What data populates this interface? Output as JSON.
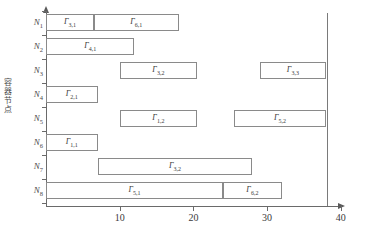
{
  "chart_data": {
    "type": "bar",
    "orientation": "horizontal",
    "title": "",
    "xlabel": "",
    "ylabel": "容器节点",
    "xlim": [
      0,
      42
    ],
    "ylim": [
      0,
      8
    ],
    "grid": false,
    "legend": null,
    "xticks": [
      10,
      20,
      30,
      40
    ],
    "xtick_labels": [
      "10",
      "20",
      "30",
      "40"
    ],
    "categories": [
      "N1",
      "N2",
      "N3",
      "N4",
      "N5",
      "N6",
      "N7",
      "N8"
    ],
    "annotations": [
      {
        "name": "threshold-line",
        "type": "vline",
        "x": 38
      }
    ],
    "rows": [
      {
        "category": "N1",
        "bars": [
          {
            "label": "Γ",
            "sub": "3,1",
            "start": 0,
            "end": 6.5
          },
          {
            "label": "Γ",
            "sub": "6,1",
            "start": 6.5,
            "end": 18
          }
        ]
      },
      {
        "category": "N2",
        "bars": [
          {
            "label": "Γ",
            "sub": "4,1",
            "start": 0,
            "end": 12
          }
        ]
      },
      {
        "category": "N3",
        "bars": [
          {
            "label": "Γ",
            "sub": "3,2",
            "start": 10,
            "end": 20.5
          },
          {
            "label": "Γ",
            "sub": "3,3",
            "start": 29,
            "end": 38
          }
        ]
      },
      {
        "category": "N4",
        "bars": [
          {
            "label": "Γ",
            "sub": "2,1",
            "start": 0,
            "end": 7
          }
        ]
      },
      {
        "category": "N5",
        "bars": [
          {
            "label": "Γ",
            "sub": "1,2",
            "start": 10,
            "end": 20.5
          },
          {
            "label": "Γ",
            "sub": "5,2",
            "start": 25.5,
            "end": 38
          }
        ]
      },
      {
        "category": "N6",
        "bars": [
          {
            "label": "Γ",
            "sub": "1,1",
            "start": 0,
            "end": 7
          }
        ]
      },
      {
        "category": "N7",
        "bars": [
          {
            "label": "Γ",
            "sub": "3,2",
            "start": 7,
            "end": 28
          }
        ]
      },
      {
        "category": "N8",
        "bars": [
          {
            "label": "Γ",
            "sub": "5,1",
            "start": 0,
            "end": 24
          },
          {
            "label": "Γ",
            "sub": "6,2",
            "start": 24,
            "end": 32
          }
        ]
      }
    ]
  },
  "axis": {
    "y_axis_label_chars": [
      "容",
      "器",
      "节",
      "点"
    ],
    "category_labels": [
      {
        "base": "N",
        "sub": "1"
      },
      {
        "base": "N",
        "sub": "2"
      },
      {
        "base": "N",
        "sub": "3"
      },
      {
        "base": "N",
        "sub": "4"
      },
      {
        "base": "N",
        "sub": "5"
      },
      {
        "base": "N",
        "sub": "6"
      },
      {
        "base": "N",
        "sub": "7"
      },
      {
        "base": "N",
        "sub": "8"
      }
    ]
  }
}
